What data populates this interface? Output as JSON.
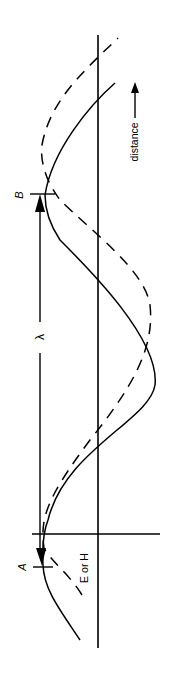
{
  "figure": {
    "labels": {
      "point_a": "A",
      "point_b": "B",
      "wavelength": "λ",
      "axis_field": "E or H",
      "axis_distance": "distance"
    },
    "curves": [
      {
        "name": "solid-wave",
        "style": "solid"
      },
      {
        "name": "dashed-wave",
        "style": "dashed"
      }
    ],
    "orientation": "rotated 90° counter-clockwise"
  }
}
